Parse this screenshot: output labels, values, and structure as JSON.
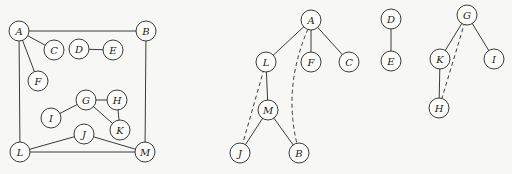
{
  "graphs": [
    {
      "id": "original-graph",
      "nodes": [
        {
          "id": "A",
          "label": "A",
          "x": 19,
          "y": 31
        },
        {
          "id": "B",
          "label": "B",
          "x": 146,
          "y": 31
        },
        {
          "id": "C",
          "label": "C",
          "x": 54,
          "y": 50
        },
        {
          "id": "D",
          "label": "D",
          "x": 79,
          "y": 49
        },
        {
          "id": "E",
          "label": "E",
          "x": 113,
          "y": 50
        },
        {
          "id": "F",
          "label": "F",
          "x": 38,
          "y": 81
        },
        {
          "id": "G",
          "label": "G",
          "x": 86,
          "y": 100
        },
        {
          "id": "H",
          "label": "H",
          "x": 117,
          "y": 100
        },
        {
          "id": "I",
          "label": "I",
          "x": 51,
          "y": 118
        },
        {
          "id": "K",
          "label": "K",
          "x": 120,
          "y": 130
        },
        {
          "id": "J",
          "label": "J",
          "x": 84,
          "y": 134
        },
        {
          "id": "L",
          "label": "L",
          "x": 20,
          "y": 152
        },
        {
          "id": "M",
          "label": "M",
          "x": 145,
          "y": 152
        }
      ],
      "edges": [
        {
          "from": "A",
          "to": "B",
          "style": "solid"
        },
        {
          "from": "A",
          "to": "C",
          "style": "solid"
        },
        {
          "from": "A",
          "to": "F",
          "style": "solid"
        },
        {
          "from": "A",
          "to": "L",
          "style": "solid"
        },
        {
          "from": "B",
          "to": "M",
          "style": "solid"
        },
        {
          "from": "D",
          "to": "E",
          "style": "solid"
        },
        {
          "from": "G",
          "to": "H",
          "style": "solid"
        },
        {
          "from": "G",
          "to": "I",
          "style": "solid"
        },
        {
          "from": "G",
          "to": "K",
          "style": "solid"
        },
        {
          "from": "H",
          "to": "K",
          "style": "solid"
        },
        {
          "from": "L",
          "to": "J",
          "style": "solid"
        },
        {
          "from": "J",
          "to": "M",
          "style": "solid"
        },
        {
          "from": "L",
          "to": "M",
          "style": "solid"
        }
      ]
    },
    {
      "id": "spanning-tree-A",
      "nodes": [
        {
          "id": "A2",
          "label": "A",
          "x": 311,
          "y": 20
        },
        {
          "id": "L2",
          "label": "L",
          "x": 266,
          "y": 62
        },
        {
          "id": "F2",
          "label": "F",
          "x": 311,
          "y": 62
        },
        {
          "id": "C2",
          "label": "C",
          "x": 349,
          "y": 62
        },
        {
          "id": "M2",
          "label": "M",
          "x": 268,
          "y": 110
        },
        {
          "id": "J2",
          "label": "J",
          "x": 240,
          "y": 153
        },
        {
          "id": "B2",
          "label": "B",
          "x": 299,
          "y": 153
        }
      ],
      "edges": [
        {
          "from": "A2",
          "to": "L2",
          "style": "solid"
        },
        {
          "from": "A2",
          "to": "F2",
          "style": "solid"
        },
        {
          "from": "A2",
          "to": "C2",
          "style": "solid"
        },
        {
          "from": "L2",
          "to": "M2",
          "style": "solid"
        },
        {
          "from": "M2",
          "to": "J2",
          "style": "solid"
        },
        {
          "from": "M2",
          "to": "B2",
          "style": "solid"
        },
        {
          "from": "L2",
          "to": "J2",
          "style": "dashed"
        },
        {
          "from": "A2",
          "to": "B2",
          "style": "dashed",
          "curve": true
        }
      ]
    },
    {
      "id": "spanning-tree-D",
      "nodes": [
        {
          "id": "D2",
          "label": "D",
          "x": 391,
          "y": 19
        },
        {
          "id": "E2",
          "label": "E",
          "x": 391,
          "y": 61
        }
      ],
      "edges": [
        {
          "from": "D2",
          "to": "E2",
          "style": "solid"
        }
      ]
    },
    {
      "id": "spanning-tree-G",
      "nodes": [
        {
          "id": "G2",
          "label": "G",
          "x": 467,
          "y": 15
        },
        {
          "id": "K2",
          "label": "K",
          "x": 440,
          "y": 59
        },
        {
          "id": "I2",
          "label": "I",
          "x": 494,
          "y": 59
        },
        {
          "id": "H2",
          "label": "H",
          "x": 439,
          "y": 108
        }
      ],
      "edges": [
        {
          "from": "G2",
          "to": "K2",
          "style": "solid"
        },
        {
          "from": "G2",
          "to": "I2",
          "style": "solid"
        },
        {
          "from": "K2",
          "to": "H2",
          "style": "solid"
        },
        {
          "from": "G2",
          "to": "H2",
          "style": "dashed"
        }
      ]
    }
  ],
  "style": {
    "node_radius": 10,
    "stroke_color": "#3a3a3a",
    "background": "#f7f7f5"
  }
}
